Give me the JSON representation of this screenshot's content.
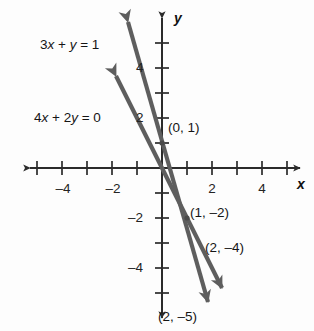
{
  "chart_data": {
    "type": "line",
    "title": "",
    "xlabel": "x",
    "ylabel": "y",
    "xlim": [
      -5.6,
      5.6
    ],
    "ylim": [
      -6.3,
      6.3
    ],
    "grid": false,
    "legend": "inline-labels",
    "x_ticks": [
      -5,
      -4,
      -3,
      -2,
      -1,
      1,
      2,
      3,
      4,
      5
    ],
    "y_ticks": [
      -6,
      -5,
      -4,
      -3,
      -2,
      -1,
      1,
      2,
      3,
      4,
      5
    ],
    "x_tick_labels": [
      {
        "value": -4,
        "text": "–4"
      },
      {
        "value": -2,
        "text": "–2"
      },
      {
        "value": 2,
        "text": "2"
      },
      {
        "value": 4,
        "text": "4"
      }
    ],
    "y_tick_labels": [
      {
        "value": 4,
        "text": "4"
      },
      {
        "value": 2,
        "text": "2"
      },
      {
        "value": -2,
        "text": "–2"
      },
      {
        "value": -4,
        "text": "–4"
      }
    ],
    "series": [
      {
        "name": "3x + y = 1",
        "label": "3x + y = 1",
        "slope": -3,
        "intercept": 1,
        "color": "#5e5e5e",
        "points": [
          [
            0,
            1
          ],
          [
            1,
            -2
          ],
          [
            2,
            -5
          ]
        ]
      },
      {
        "name": "4x + 2y = 0",
        "label": "4x + 2y = 0",
        "slope": -2,
        "intercept": 0,
        "color": "#5e5e5e",
        "points": [
          [
            0,
            0
          ],
          [
            1,
            -2
          ],
          [
            2,
            -4
          ]
        ]
      }
    ],
    "annotations": [
      {
        "text": "(0, 1)",
        "point": [
          0,
          1
        ]
      },
      {
        "text": "(1, –2)",
        "point": [
          1,
          -2
        ]
      },
      {
        "text": "(2, –4)",
        "point": [
          2,
          -4
        ]
      },
      {
        "text": "(2, –5)",
        "point": [
          2,
          -5
        ]
      }
    ]
  },
  "equations": {
    "line1_a": "3",
    "line1_x": "x",
    "line1_plus": " + ",
    "line1_y": "y",
    "line1_rhs": " = 1",
    "line1_full": "3x + y = 1",
    "line2_full": "4x + 2y = 0"
  },
  "axes": {
    "x_name": "x",
    "y_name": "y"
  },
  "tick_labels": {
    "x_neg4": "–4",
    "x_neg2": "–2",
    "x_pos2": "2",
    "x_pos4": "4",
    "y_pos4": "4",
    "y_pos2": "2",
    "y_neg2": "–2",
    "y_neg4": "–4"
  },
  "point_labels": {
    "p0_1": "(0, 1)",
    "p1_neg2": "(1, –2)",
    "p2_neg4": "(2, –4)",
    "p2_neg5": "(2, –5)"
  },
  "colors": {
    "line": "#5e5e5e",
    "axis": "#2b2b2b",
    "text": "#151515",
    "background": "#fdfdfd"
  }
}
